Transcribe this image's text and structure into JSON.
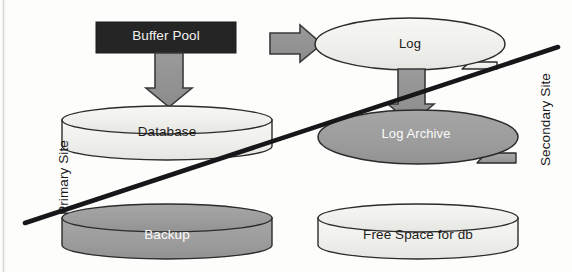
{
  "diagram": {
    "width": 572,
    "height": 272,
    "background_color": "#fdfdfc",
    "colors": {
      "dark_fill": "#252525",
      "gray_fill": "#9d9d9d",
      "light_fill": "#f2f2f0",
      "outline": "#2b2b2b",
      "text_dark": "#1d1d1b",
      "text_light": "#fbfbfa",
      "divider_line": "#17171a"
    },
    "site_labels": {
      "primary": "Primary Site",
      "secondary": "Secondary Site"
    },
    "nodes": [
      {
        "id": "buffer-pool",
        "label": "Buffer Pool",
        "shape": "rectangle",
        "fill": "dark",
        "site": "primary"
      },
      {
        "id": "log",
        "label": "Log",
        "shape": "ellipse-with-tail",
        "fill": "light",
        "site": "primary"
      },
      {
        "id": "database",
        "label": "Database",
        "shape": "cylinder",
        "fill": "light",
        "site": "primary"
      },
      {
        "id": "log-archive",
        "label": "Log Archive",
        "shape": "ellipse-with-tail",
        "fill": "gray",
        "site": "secondary"
      },
      {
        "id": "backup",
        "label": "Backup",
        "shape": "cylinder",
        "fill": "gray",
        "site": "primary"
      },
      {
        "id": "free-space",
        "label": "Free Space for db",
        "shape": "cylinder",
        "fill": "light",
        "site": "secondary"
      }
    ],
    "arrows": [
      {
        "id": "buffer-pool-to-log",
        "from": "buffer-pool",
        "to": "log",
        "direction": "right"
      },
      {
        "id": "buffer-pool-to-database",
        "from": "buffer-pool",
        "to": "database",
        "direction": "down"
      },
      {
        "id": "log-to-log-archive",
        "from": "log",
        "to": "log-archive",
        "direction": "down"
      }
    ],
    "divider": {
      "id": "site-divider",
      "description": "Diagonal line separating Primary Site from Secondary Site",
      "from": [
        25,
        223
      ],
      "to": [
        558,
        47
      ]
    }
  }
}
